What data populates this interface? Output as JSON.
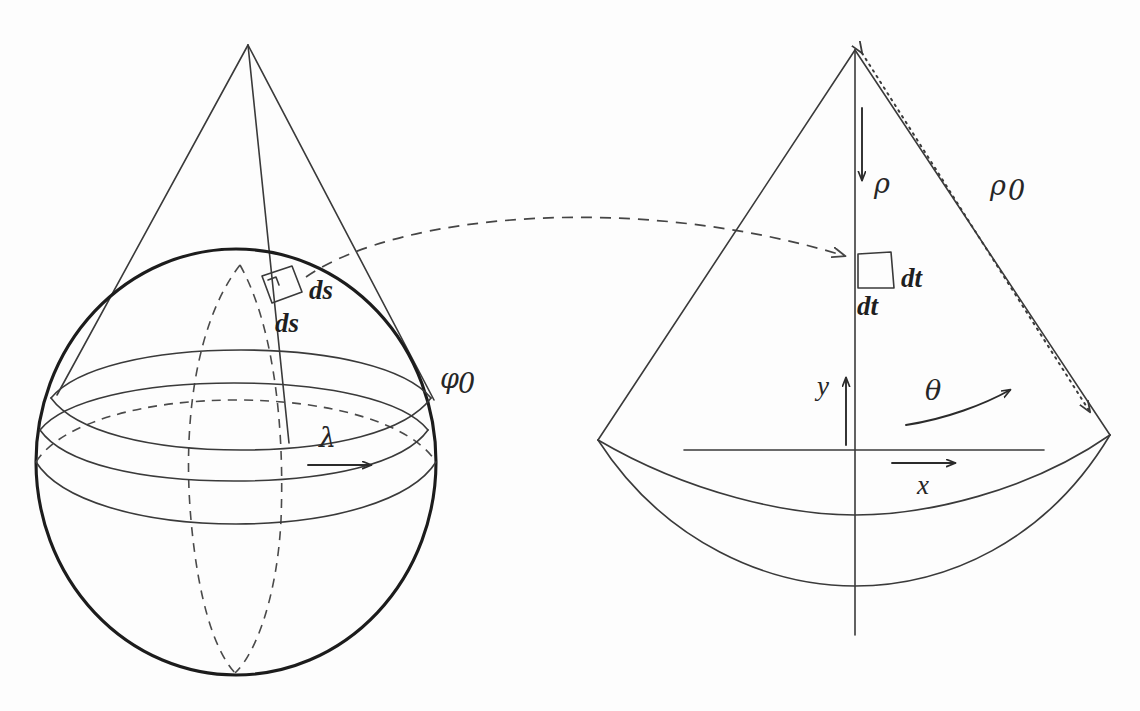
{
  "figure": {
    "background_color": "#fdfdfd",
    "line_color": "#3a3a3a",
    "bold_line_color": "#1c1c1c",
    "dashed_line_color": "#454545"
  },
  "left_panel": {
    "name": "sphere-with-tangent-cone",
    "labels": {
      "ds_upper": "ds",
      "ds_lower": "ds",
      "phi0": "φ",
      "phi0_sub": "0",
      "lambda": "λ"
    }
  },
  "right_panel": {
    "name": "unrolled-cone-sector",
    "labels": {
      "rho": "ρ",
      "rho0": "ρ",
      "rho0_sub": "0",
      "dt_right": "dt",
      "dt_below": "dt",
      "y_axis": "y",
      "x_axis": "x",
      "theta": "θ"
    }
  },
  "connector": {
    "name": "mapping-arrow",
    "style": "dashed curved arrow pointing right"
  }
}
